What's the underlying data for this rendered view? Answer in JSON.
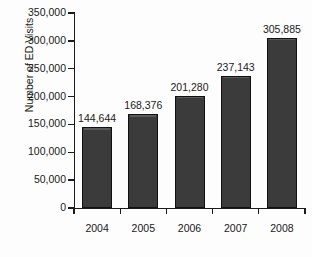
{
  "chart_data": {
    "type": "bar",
    "title": "",
    "subtitle": "",
    "xlabel": "",
    "ylabel": "Number of ED Visits",
    "categories": [
      "2004",
      "2005",
      "2006",
      "2007",
      "2008"
    ],
    "values": [
      144644,
      168376,
      201280,
      237143,
      305885
    ],
    "value_labels": [
      "144,644",
      "168,376",
      "201,280",
      "237,143",
      "305,885"
    ],
    "ylim": [
      0,
      350000
    ],
    "ytick_values": [
      0,
      50000,
      100000,
      150000,
      200000,
      250000,
      300000,
      350000
    ],
    "ytick_labels": [
      "0",
      "50,000",
      "100,000",
      "150,000",
      "200,000",
      "250,000",
      "300,000",
      "350,000"
    ],
    "grid": false,
    "legend": false,
    "legend_position": "none",
    "bar_color": "#3b3b3b",
    "bar_edge_color": "#111111",
    "axis_color": "#1b1b1b",
    "background_color": "#fdfdfd",
    "text_color": "#1a1a1a"
  }
}
